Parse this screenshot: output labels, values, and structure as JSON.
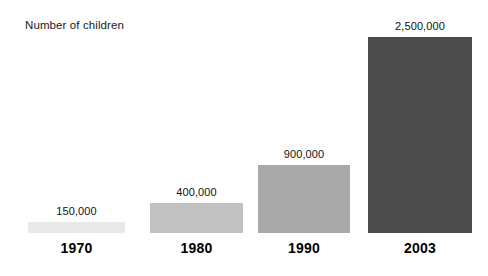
{
  "chart_data": {
    "type": "bar",
    "title": "Number of children",
    "xlabel": "",
    "ylabel": "Number of children",
    "categories": [
      "1970",
      "1980",
      "1990",
      "2003"
    ],
    "values": [
      150000,
      900000,
      900000,
      2500000
    ],
    "value_labels": [
      "150,000",
      "400,000",
      "900,000",
      "2,500,000"
    ],
    "series": [
      {
        "name": "Number of children",
        "values": [
          150000,
          400000,
          900000,
          2500000
        ]
      }
    ],
    "grid": false,
    "legend": false,
    "legend_position": "none",
    "axis_visible": false,
    "ylim": [
      0,
      2500000
    ],
    "note": "Bar heights are not drawn strictly proportional to the values; the smallest bars are visually exaggerated.",
    "bar_colors": [
      "#e9e9e9",
      "#c1c1c1",
      "#a9a9a9",
      "#4b4b4b"
    ],
    "background_color": "#ffffff",
    "text_color": "#111111",
    "bars": [
      {
        "category": "1970",
        "value": 150000,
        "value_label": "150,000",
        "color": "#e9e9e9",
        "left_px": 28,
        "width_px": 97,
        "top_px": 222,
        "height_px": 11,
        "baseline_px": 233
      },
      {
        "category": "1980",
        "value": 400000,
        "value_label": "400,000",
        "color": "#c1c1c1",
        "left_px": 150,
        "width_px": 93,
        "top_px": 203,
        "height_px": 30,
        "baseline_px": 233
      },
      {
        "category": "1990",
        "value": 900000,
        "value_label": "900,000",
        "color": "#a9a9a9",
        "left_px": 258,
        "width_px": 92,
        "top_px": 165,
        "height_px": 68,
        "baseline_px": 233
      },
      {
        "category": "2003",
        "value": 2500000,
        "value_label": "2,500,000",
        "color": "#4b4b4b",
        "left_px": 368,
        "width_px": 104,
        "top_px": 37,
        "height_px": 196,
        "baseline_px": 233
      }
    ]
  }
}
